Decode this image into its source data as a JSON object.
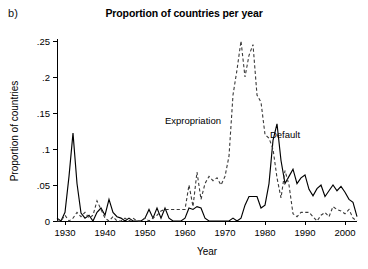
{
  "figure": {
    "panel_label": "b)",
    "title": "Proportion of countries per year"
  },
  "chart_data": {
    "type": "line",
    "title": "Proportion of countries per year",
    "xlabel": "Year",
    "ylabel": "Proportion of countries",
    "xlim": [
      1928,
      2003
    ],
    "ylim": [
      0,
      0.26
    ],
    "grid": false,
    "legend_position": "inline-annotations",
    "xticks": [
      1930,
      1940,
      1950,
      1960,
      1970,
      1980,
      1990,
      2000
    ],
    "xtick_labels": [
      "1930",
      "1940",
      "1950",
      "1960",
      "1970",
      "1980",
      "1990",
      "2000"
    ],
    "yticks": [
      0,
      0.05,
      0.1,
      0.15,
      0.2,
      0.25
    ],
    "ytick_labels": [
      "0",
      ".05",
      ".1",
      ".15",
      ".2",
      ".25"
    ],
    "annotations": [
      {
        "text": "Expropriation",
        "x": 1962,
        "y": 0.135
      },
      {
        "text": "Default",
        "x": 1985,
        "y": 0.115
      }
    ],
    "series": [
      {
        "name": "Default",
        "style": "solid",
        "color": "#000000",
        "x": [
          1928,
          1929,
          1930,
          1931,
          1932,
          1933,
          1934,
          1935,
          1936,
          1937,
          1938,
          1939,
          1940,
          1941,
          1942,
          1943,
          1944,
          1945,
          1946,
          1947,
          1948,
          1949,
          1950,
          1951,
          1952,
          1953,
          1954,
          1955,
          1956,
          1957,
          1958,
          1959,
          1960,
          1961,
          1962,
          1963,
          1964,
          1965,
          1966,
          1967,
          1968,
          1969,
          1970,
          1971,
          1972,
          1973,
          1974,
          1975,
          1976,
          1977,
          1978,
          1979,
          1980,
          1981,
          1982,
          1983,
          1984,
          1985,
          1986,
          1987,
          1988,
          1989,
          1990,
          1991,
          1992,
          1993,
          1994,
          1995,
          1996,
          1997,
          1998,
          1999,
          2000,
          2001,
          2002,
          2003
        ],
        "y": [
          0.004,
          0.0,
          0.012,
          0.062,
          0.122,
          0.052,
          0.011,
          0.004,
          0.008,
          0.0,
          0.012,
          0.018,
          0.008,
          0.03,
          0.012,
          0.006,
          0.004,
          0.0,
          0.004,
          0.0,
          0.0,
          0.0,
          0.004,
          0.016,
          0.004,
          0.018,
          0.004,
          0.018,
          0.004,
          0.0,
          0.0,
          0.0,
          0.004,
          0.018,
          0.016,
          0.02,
          0.018,
          0.004,
          0.0,
          0.0,
          0.0,
          0.0,
          0.0,
          0.0,
          0.004,
          0.0,
          0.004,
          0.022,
          0.034,
          0.034,
          0.034,
          0.018,
          0.022,
          0.052,
          0.112,
          0.135,
          0.084,
          0.052,
          0.062,
          0.072,
          0.052,
          0.06,
          0.064,
          0.044,
          0.035,
          0.045,
          0.05,
          0.034,
          0.042,
          0.05,
          0.042,
          0.048,
          0.04,
          0.03,
          0.026,
          0.006
        ]
      },
      {
        "name": "Expropriation",
        "style": "dashed",
        "color": "#3a3a3a",
        "x": [
          1928,
          1929,
          1930,
          1931,
          1932,
          1933,
          1934,
          1935,
          1936,
          1937,
          1938,
          1939,
          1940,
          1941,
          1942,
          1943,
          1944,
          1945,
          1946,
          1947,
          1948,
          1949,
          1950,
          1951,
          1952,
          1953,
          1954,
          1955,
          1956,
          1957,
          1958,
          1959,
          1960,
          1961,
          1962,
          1963,
          1964,
          1965,
          1966,
          1967,
          1968,
          1969,
          1970,
          1971,
          1972,
          1973,
          1974,
          1975,
          1976,
          1977,
          1978,
          1979,
          1980,
          1981,
          1982,
          1983,
          1984,
          1985,
          1986,
          1987,
          1988,
          1989,
          1990,
          1991,
          1992,
          1993,
          1994,
          1995,
          1996,
          1997,
          1998,
          1999,
          2000,
          2001,
          2002,
          2003
        ],
        "y": [
          0.0,
          0.0,
          0.008,
          0.0,
          0.004,
          0.012,
          0.006,
          0.012,
          0.004,
          0.008,
          0.028,
          0.016,
          0.004,
          0.0,
          0.006,
          0.0,
          0.0,
          0.004,
          0.0,
          0.004,
          0.0,
          0.0,
          0.004,
          0.0,
          0.004,
          0.008,
          0.014,
          0.016,
          0.016,
          0.016,
          0.016,
          0.016,
          0.016,
          0.05,
          0.02,
          0.068,
          0.03,
          0.052,
          0.062,
          0.056,
          0.06,
          0.05,
          0.062,
          0.09,
          0.175,
          0.21,
          0.25,
          0.2,
          0.23,
          0.245,
          0.175,
          0.165,
          0.12,
          0.115,
          0.1,
          0.06,
          0.032,
          0.07,
          0.05,
          0.01,
          0.006,
          0.012,
          0.012,
          0.012,
          0.006,
          0.0,
          0.008,
          0.012,
          0.006,
          0.02,
          0.016,
          0.014,
          0.01,
          0.016,
          0.004,
          0.0
        ]
      }
    ]
  }
}
